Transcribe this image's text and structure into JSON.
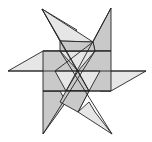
{
  "figure": {
    "caption": "",
    "colors": {
      "light": "#e6e6e6",
      "dark": "#c9c9c9",
      "stroke": "#222222"
    }
  }
}
